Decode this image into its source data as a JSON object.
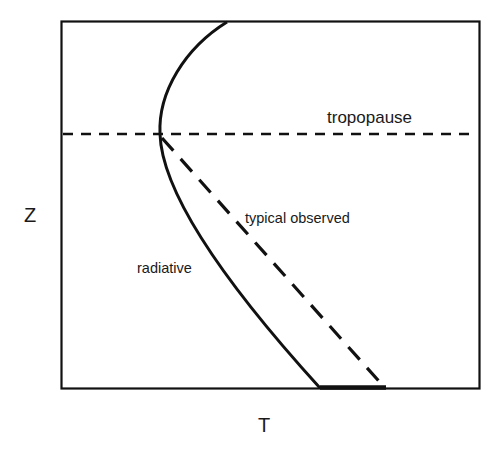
{
  "diagram": {
    "type": "temperature-altitude-profile",
    "axes": {
      "x_label": "T",
      "y_label": "Z"
    },
    "labels": {
      "tropopause": "tropopause",
      "typical_observed": "typical observed",
      "radiative": "radiative"
    },
    "curves": [
      {
        "name": "radiative",
        "style": "solid",
        "description": "Radiative equilibrium profile, curving to a temperature minimum at the tropopause"
      },
      {
        "name": "typical observed",
        "style": "dashed",
        "description": "Observed lapse rate, linear from warm surface to tropopause"
      },
      {
        "name": "tropopause",
        "style": "dashed",
        "orientation": "horizontal"
      }
    ],
    "colors": {
      "line": "#111111",
      "text": "#1a1a1a",
      "background": "#ffffff"
    }
  }
}
